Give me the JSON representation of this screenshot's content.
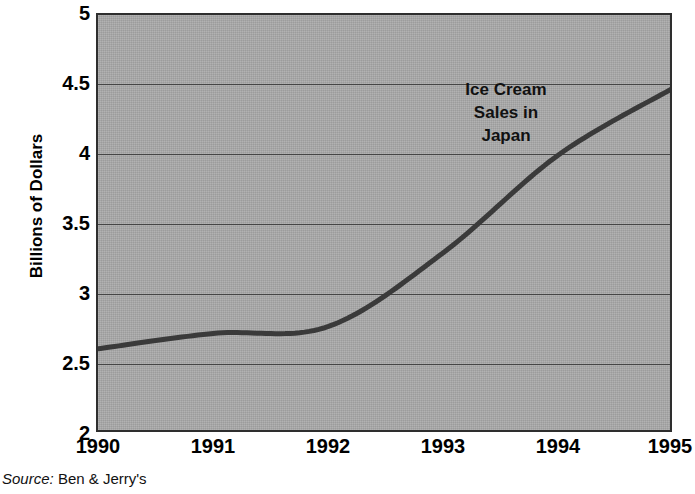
{
  "chart_data": {
    "type": "line",
    "title": "",
    "annotation": [
      "Ice Cream",
      "Sales in",
      "Japan"
    ],
    "annotation_text": "Ice Cream Sales in Japan",
    "xlabel": "",
    "ylabel": "Billions of Dollars",
    "categories": [
      "1990",
      "1991",
      "1992",
      "1993",
      "1994",
      "1995"
    ],
    "x": [
      1990,
      1991,
      1992,
      1993,
      1994,
      1995
    ],
    "values": [
      2.61,
      2.72,
      2.77,
      3.3,
      4.0,
      4.48
    ],
    "series": [
      {
        "name": "Ice Cream Sales in Japan",
        "values": [
          2.61,
          2.72,
          2.77,
          3.3,
          4.0,
          4.48
        ]
      }
    ],
    "ylim": [
      2,
      5
    ],
    "xlim": [
      1990,
      1995
    ],
    "ytick_labels": [
      "5",
      "4.5",
      "4",
      "3.5",
      "3",
      "2.5",
      "2"
    ],
    "ytick_values": [
      5,
      4.5,
      4,
      3.5,
      3,
      2.5,
      2
    ],
    "xtick_labels": [
      "1990",
      "1991",
      "1992",
      "1993",
      "1994",
      "1995"
    ],
    "grid": true,
    "grid_axis": "y",
    "legend": "none",
    "plot_background": "#a9a9a9",
    "line_color": "#3a3a3a",
    "gridline_color": "#454545",
    "border_color": "#2e2e2e",
    "text_color": "#000000"
  },
  "source": {
    "label": "Source:",
    "value": "Ben & Jerry's"
  }
}
